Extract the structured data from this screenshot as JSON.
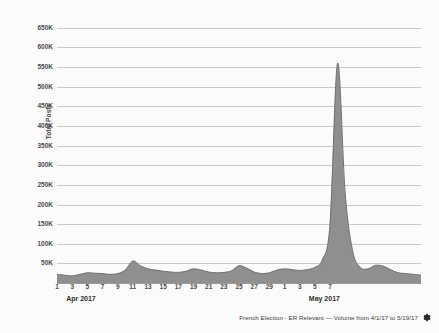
{
  "chart_data": {
    "type": "area",
    "title": "",
    "xlabel": "",
    "ylabel": "Total Posts",
    "ylim": [
      0,
      675000
    ],
    "grid": true,
    "legend": "none",
    "y_ticks": [
      "50K",
      "100K",
      "150K",
      "200K",
      "250K",
      "300K",
      "350K",
      "400K",
      "450K",
      "500K",
      "550K",
      "600K",
      "650K"
    ],
    "y_tick_values": [
      50000,
      100000,
      150000,
      200000,
      250000,
      300000,
      350000,
      400000,
      450000,
      500000,
      550000,
      600000,
      650000
    ],
    "x_tick_labels": [
      "1",
      "3",
      "5",
      "7",
      "9",
      "11",
      "13",
      "15",
      "17",
      "19",
      "21",
      "23",
      "25",
      "27",
      "29",
      "1",
      "3",
      "5",
      "7"
    ],
    "month_labels": [
      {
        "label": "Apr 2017",
        "day_index": 2
      },
      {
        "label": "May 2017",
        "day_index": 34
      }
    ],
    "x_day_labels": [
      "4/1",
      "4/2",
      "4/3",
      "4/4",
      "4/5",
      "4/6",
      "4/7",
      "4/8",
      "4/9",
      "4/10",
      "4/11",
      "4/12",
      "4/13",
      "4/14",
      "4/15",
      "4/16",
      "4/17",
      "4/18",
      "4/19",
      "4/20",
      "4/21",
      "4/22",
      "4/23",
      "4/24",
      "4/25",
      "4/26",
      "4/27",
      "4/28",
      "4/29",
      "4/30",
      "5/1",
      "5/2",
      "5/3",
      "5/4",
      "5/5",
      "5/6",
      "5/7",
      "5/8",
      "5/9",
      "5/10",
      "5/11",
      "5/12",
      "5/13",
      "5/14",
      "5/15",
      "5/16",
      "5/17",
      "5/18",
      "5/19"
    ],
    "values": [
      22000,
      20000,
      18000,
      22000,
      26000,
      25000,
      24000,
      22000,
      24000,
      33000,
      56000,
      44000,
      36000,
      33000,
      30000,
      28000,
      27000,
      30000,
      36000,
      33000,
      28000,
      26000,
      27000,
      31000,
      44000,
      38000,
      28000,
      24000,
      26000,
      33000,
      36000,
      34000,
      32000,
      34000,
      40000,
      60000,
      150000,
      560000,
      230000,
      80000,
      40000,
      36000,
      45000,
      43000,
      34000,
      26000,
      24000,
      22000,
      20000
    ],
    "series_name": "Total Posts",
    "colors": {
      "area_fill": "#8f8f8f",
      "area_stroke": "#6f6f6f",
      "gridline": "#c9c9c9",
      "axis": "#9a9a9a",
      "tick_text": "#4a4a4a",
      "background": "#fbfbfb"
    }
  },
  "caption": {
    "text": "French Election - ER Relevant — Volume from 4/1/17 to 5/19/17",
    "gear_icon": "gear-icon"
  }
}
